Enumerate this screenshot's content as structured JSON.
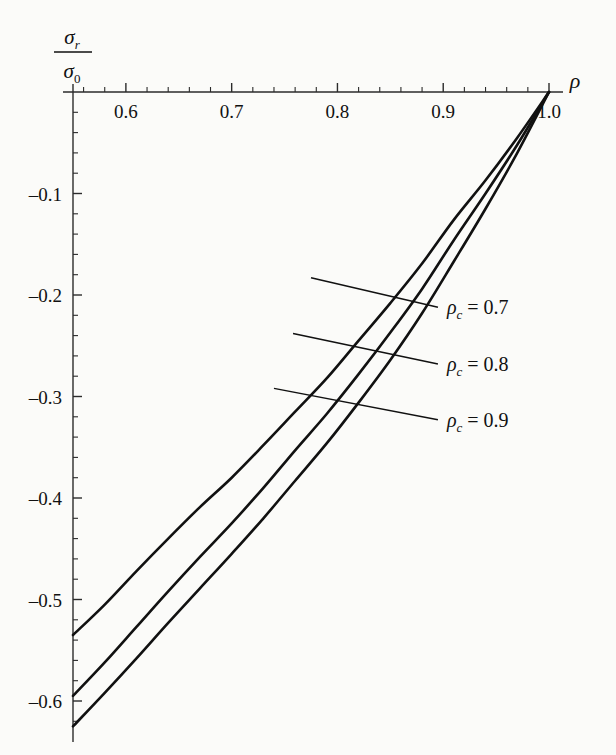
{
  "figure": {
    "background_color": "#fbfbf9",
    "ink_color": "#111111",
    "axis_color": "#2b2b2b"
  },
  "axis_titles": {
    "y_numerator_symbol": "σ",
    "y_numerator_sub": "r",
    "y_denominator_symbol": "σ",
    "y_denominator_sub": "0",
    "x_symbol": "ρ"
  },
  "x_tick_labels": [
    "0.6",
    "0.7",
    "0.8",
    "0.9",
    "1.0"
  ],
  "y_tick_labels": [
    "–0.1",
    "–0.2",
    "–0.3",
    "–0.4",
    "–0.5",
    "–0.6"
  ],
  "annotations": [
    {
      "symbol": "ρ",
      "sub": "c",
      "eq": "= 0.7"
    },
    {
      "symbol": "ρ",
      "sub": "c",
      "eq": "= 0.8"
    },
    {
      "symbol": "ρ",
      "sub": "c",
      "eq": "= 0.9"
    }
  ],
  "chart_data": {
    "type": "line",
    "title": "",
    "xlabel": "ρ",
    "ylabel": "σ_r / σ_0",
    "xlim": [
      0.55,
      1.02
    ],
    "ylim": [
      -0.64,
      0.015
    ],
    "grid": false,
    "legend_position": "inline-annotation-right",
    "x_major_ticks": [
      0.6,
      0.7,
      0.8,
      0.9,
      1.0
    ],
    "x_minor_tick_step": 0.02,
    "y_major_ticks": [
      -0.1,
      -0.2,
      -0.3,
      -0.4,
      -0.5,
      -0.6
    ],
    "y_minor_tick_step": 0.02,
    "series": [
      {
        "name": "ρ_c = 0.7",
        "rho_c": 0.7,
        "x": [
          0.55,
          0.58,
          0.61,
          0.64,
          0.67,
          0.7,
          0.73,
          0.76,
          0.79,
          0.82,
          0.85,
          0.88,
          0.91,
          0.94,
          0.97,
          1.0
        ],
        "values": [
          -0.535,
          -0.505,
          -0.472,
          -0.44,
          -0.409,
          -0.38,
          -0.348,
          -0.315,
          -0.282,
          -0.245,
          -0.208,
          -0.169,
          -0.126,
          -0.087,
          -0.045,
          0.0
        ]
      },
      {
        "name": "ρ_c = 0.8",
        "rho_c": 0.8,
        "x": [
          0.55,
          0.58,
          0.61,
          0.64,
          0.67,
          0.7,
          0.73,
          0.76,
          0.79,
          0.82,
          0.85,
          0.88,
          0.91,
          0.94,
          0.97,
          1.0
        ],
        "values": [
          -0.595,
          -0.562,
          -0.527,
          -0.492,
          -0.458,
          -0.425,
          -0.39,
          -0.353,
          -0.317,
          -0.278,
          -0.237,
          -0.194,
          -0.146,
          -0.1,
          -0.052,
          0.0
        ]
      },
      {
        "name": "ρ_c = 0.9",
        "rho_c": 0.9,
        "x": [
          0.55,
          0.58,
          0.61,
          0.64,
          0.67,
          0.7,
          0.73,
          0.76,
          0.79,
          0.82,
          0.85,
          0.88,
          0.91,
          0.94,
          0.97,
          1.0
        ],
        "values": [
          -0.625,
          -0.592,
          -0.558,
          -0.523,
          -0.489,
          -0.455,
          -0.42,
          -0.383,
          -0.346,
          -0.306,
          -0.264,
          -0.218,
          -0.167,
          -0.115,
          -0.06,
          0.0
        ]
      }
    ]
  },
  "leader_lines": [
    {
      "from_x": 0.775,
      "from_y": -0.183,
      "to_x": 0.895,
      "to_y": -0.212
    },
    {
      "from_x": 0.758,
      "from_y": -0.238,
      "to_x": 0.895,
      "to_y": -0.268
    },
    {
      "from_x": 0.74,
      "from_y": -0.292,
      "to_x": 0.895,
      "to_y": -0.323
    }
  ]
}
